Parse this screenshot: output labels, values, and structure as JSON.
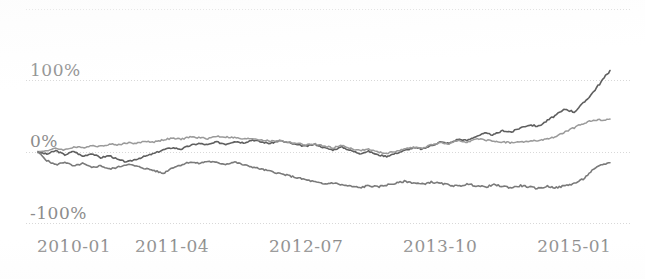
{
  "chart_data": {
    "type": "line",
    "title": "",
    "subtitle": "",
    "xlabel": "",
    "ylabel": "",
    "ylim": [
      -100,
      200
    ],
    "xlim": [
      0,
      64
    ],
    "grid": true,
    "grid_values": [
      200,
      100,
      0,
      -100
    ],
    "legend": "none",
    "y_tick_labels": [
      "100%",
      "0%",
      "-100%"
    ],
    "y_tick_values": [
      100,
      0,
      -100
    ],
    "x_tick_labels": [
      "2010-01",
      "2011-04",
      "2012-07",
      "2013-10",
      "2015-01"
    ],
    "x_tick_values": [
      0,
      15,
      30,
      45,
      60
    ],
    "x_unit": "month",
    "value_unit": "percent_return",
    "colors": {
      "series_a": "#5f5f5f",
      "series_b": "#9a9a9a",
      "series_c": "#7a7a7a",
      "gridline": "#d8d8d8",
      "axis_text": "#8c8c8c",
      "background": "#ffffff"
    },
    "series": [
      {
        "name": "series_a",
        "color": "#5f5f5f",
        "width": 1.6,
        "x": [
          0,
          1,
          2,
          3,
          4,
          5,
          6,
          7,
          8,
          9,
          10,
          11,
          12,
          13,
          14,
          15,
          16,
          17,
          18,
          19,
          20,
          21,
          22,
          23,
          24,
          25,
          26,
          27,
          28,
          29,
          30,
          31,
          32,
          33,
          34,
          35,
          36,
          37,
          38,
          39,
          40,
          41,
          42,
          43,
          44,
          45,
          46,
          47,
          48,
          49,
          50,
          51,
          52,
          53,
          54,
          55,
          56,
          57,
          58,
          59,
          60,
          61,
          62,
          63,
          64
        ],
        "values": [
          0,
          -3,
          2,
          -4,
          1,
          -6,
          -2,
          -8,
          -5,
          -11,
          -14,
          -10,
          -6,
          -2,
          3,
          6,
          4,
          9,
          12,
          10,
          14,
          11,
          15,
          13,
          17,
          14,
          12,
          16,
          13,
          10,
          8,
          11,
          6,
          3,
          7,
          2,
          -2,
          1,
          -4,
          -6,
          -2,
          2,
          6,
          4,
          9,
          14,
          12,
          18,
          16,
          22,
          26,
          24,
          30,
          28,
          34,
          38,
          36,
          44,
          52,
          60,
          56,
          68,
          82,
          98,
          114
        ]
      },
      {
        "name": "series_b",
        "color": "#9a9a9a",
        "width": 1.5,
        "x": [
          0,
          1,
          2,
          3,
          4,
          5,
          6,
          7,
          8,
          9,
          10,
          11,
          12,
          13,
          14,
          15,
          16,
          17,
          18,
          19,
          20,
          21,
          22,
          23,
          24,
          25,
          26,
          27,
          28,
          29,
          30,
          31,
          32,
          33,
          34,
          35,
          36,
          37,
          38,
          39,
          40,
          41,
          42,
          43,
          44,
          45,
          46,
          47,
          48,
          49,
          50,
          51,
          52,
          53,
          54,
          55,
          56,
          57,
          58,
          59,
          60,
          61,
          62,
          63,
          64
        ],
        "values": [
          0,
          2,
          5,
          3,
          7,
          6,
          9,
          8,
          11,
          10,
          13,
          12,
          15,
          14,
          17,
          19,
          18,
          21,
          20,
          19,
          22,
          21,
          20,
          18,
          19,
          17,
          15,
          16,
          14,
          12,
          10,
          11,
          8,
          6,
          9,
          5,
          2,
          4,
          0,
          -2,
          1,
          4,
          7,
          5,
          10,
          13,
          11,
          16,
          14,
          18,
          17,
          15,
          14,
          13,
          14,
          15,
          16,
          18,
          22,
          28,
          34,
          40,
          44,
          45,
          46
        ]
      },
      {
        "name": "series_c",
        "color": "#7a7a7a",
        "width": 1.6,
        "x": [
          0,
          1,
          2,
          3,
          4,
          5,
          6,
          7,
          8,
          9,
          10,
          11,
          12,
          13,
          14,
          15,
          16,
          17,
          18,
          19,
          20,
          21,
          22,
          23,
          24,
          25,
          26,
          27,
          28,
          29,
          30,
          31,
          32,
          33,
          34,
          35,
          36,
          37,
          38,
          39,
          40,
          41,
          42,
          43,
          44,
          45,
          46,
          47,
          48,
          49,
          50,
          51,
          52,
          53,
          54,
          55,
          56,
          57,
          58,
          59,
          60,
          61,
          62,
          63,
          64
        ],
        "values": [
          0,
          -12,
          -18,
          -14,
          -20,
          -16,
          -22,
          -19,
          -24,
          -21,
          -17,
          -20,
          -23,
          -26,
          -30,
          -22,
          -18,
          -14,
          -16,
          -13,
          -15,
          -17,
          -14,
          -18,
          -21,
          -24,
          -27,
          -30,
          -33,
          -36,
          -39,
          -42,
          -45,
          -43,
          -46,
          -48,
          -50,
          -47,
          -49,
          -46,
          -44,
          -41,
          -43,
          -45,
          -42,
          -44,
          -46,
          -48,
          -45,
          -47,
          -49,
          -46,
          -48,
          -50,
          -47,
          -49,
          -51,
          -48,
          -50,
          -47,
          -44,
          -38,
          -26,
          -18,
          -15
        ]
      }
    ]
  },
  "axis": {
    "y_labels": [
      {
        "text": "100%",
        "value": 100
      },
      {
        "text": "0%",
        "value": 0
      },
      {
        "text": "-100%",
        "value": -100
      }
    ],
    "x_labels": [
      {
        "text": "2010-01",
        "value": 0
      },
      {
        "text": "2011-04",
        "value": 15
      },
      {
        "text": "2012-07",
        "value": 30
      },
      {
        "text": "2013-10",
        "value": 45
      },
      {
        "text": "2015-01",
        "value": 60
      }
    ]
  }
}
